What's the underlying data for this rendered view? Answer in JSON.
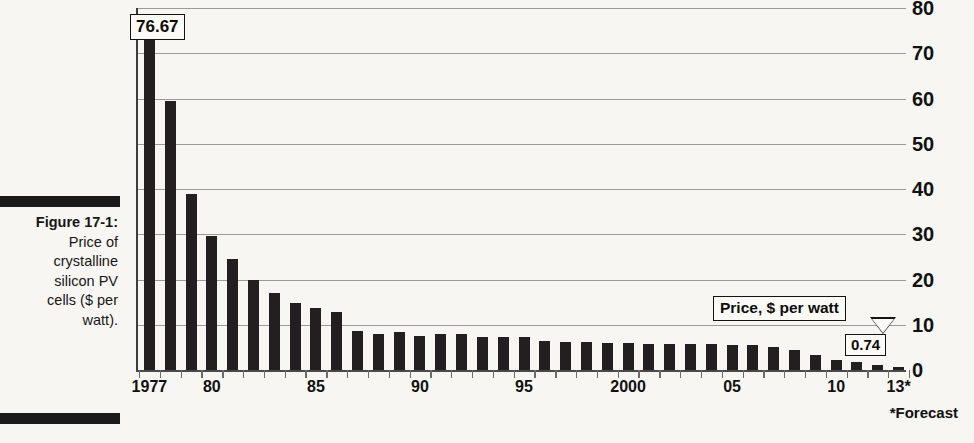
{
  "figure": {
    "number_label": "Figure 17-1:",
    "caption_lines": [
      "Price of",
      "crystalline",
      "silicon PV",
      "cells ($ per",
      "watt)."
    ],
    "caption_full": "Figure 17-1: Price of crystalline silicon PV cells ($ per watt)."
  },
  "footnote": "*Forecast",
  "annotations": {
    "max_value_label": "76.67",
    "series_label": "Price, $ per watt",
    "min_value_label": "0.74"
  },
  "colors": {
    "bar": "#231f20",
    "gridline": "#9a9a9a",
    "axis": "#3d3d3d",
    "background": "#f7f6f2",
    "text": "#111111"
  },
  "chart_data": {
    "type": "bar",
    "title": "Price of crystalline silicon PV cells ($ per watt)",
    "subtitle": "",
    "xlabel": "",
    "ylabel": "Price, $ per watt",
    "ylim": [
      0,
      80
    ],
    "yticks": [
      0,
      10,
      20,
      30,
      40,
      50,
      60,
      70,
      80
    ],
    "ytick_labels": [
      "0",
      "10",
      "20",
      "30",
      "40",
      "50",
      "60",
      "70",
      "80"
    ],
    "y_axis_position": "right",
    "grid": true,
    "legend": false,
    "xtick_labels": [
      "1977",
      "80",
      "85",
      "90",
      "95",
      "2000",
      "05",
      "10",
      "13*"
    ],
    "xtick_indices": [
      0,
      3,
      8,
      13,
      18,
      23,
      28,
      33,
      36
    ],
    "categories": [
      "1977",
      "1978",
      "1979",
      "1980",
      "1981",
      "1982",
      "1983",
      "1984",
      "1985",
      "1986",
      "1987",
      "1988",
      "1989",
      "1990",
      "1991",
      "1992",
      "1993",
      "1994",
      "1995",
      "1996",
      "1997",
      "1998",
      "1999",
      "2000",
      "2001",
      "2002",
      "2003",
      "2004",
      "2005",
      "2006",
      "2007",
      "2008",
      "2009",
      "2010",
      "2011",
      "2012",
      "2013"
    ],
    "values": [
      76.67,
      59.5,
      39.0,
      29.7,
      24.6,
      20.0,
      17.0,
      14.8,
      13.6,
      12.9,
      8.6,
      8.0,
      8.3,
      7.6,
      8.0,
      8.0,
      7.3,
      7.2,
      7.4,
      6.5,
      6.3,
      6.2,
      6.0,
      5.9,
      5.8,
      5.8,
      5.7,
      5.8,
      5.6,
      5.5,
      5.0,
      4.4,
      3.3,
      2.2,
      1.7,
      1.0,
      0.74
    ],
    "data_label_first": "76.67",
    "data_label_last": "0.74",
    "note": "*Forecast"
  }
}
